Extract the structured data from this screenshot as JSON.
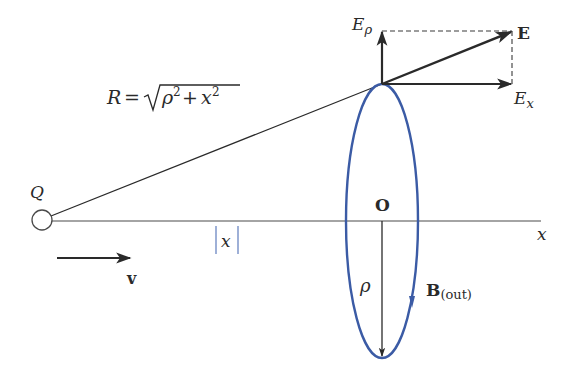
{
  "diagram": {
    "charge": {
      "label": "Q"
    },
    "velocity": {
      "label": "v"
    },
    "axis": {
      "label": "x",
      "origin_label": "O"
    },
    "distance": {
      "label": "x",
      "display": "|x|"
    },
    "radius_formula": {
      "lhs": "R",
      "eq": "=",
      "rho": "ρ",
      "sup2": "2",
      "plus": "+",
      "x": "x"
    },
    "field_E": {
      "label": "E"
    },
    "field_Erho": {
      "base": "E",
      "sub": "ρ"
    },
    "field_Ex": {
      "base": "E",
      "sub": "x"
    },
    "loop_radius": {
      "label": "ρ"
    },
    "field_B": {
      "base": "B",
      "sub": "(out)"
    },
    "colors": {
      "ink": "#2a2a2a",
      "loop": "#3b5ba5",
      "abs_bars": "#6a86c2",
      "background": "#ffffff"
    }
  }
}
